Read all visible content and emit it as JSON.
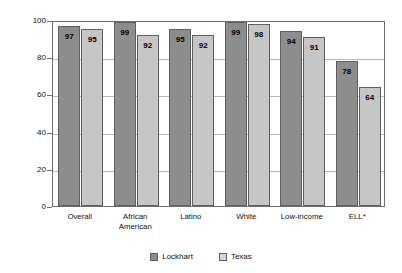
{
  "chart_data": {
    "type": "bar",
    "title": "",
    "subtitle": "",
    "xlabel": "",
    "ylabel": "Percentage of students meeting standards",
    "ylim": [
      0,
      100
    ],
    "yticks": [
      0,
      20,
      40,
      60,
      80,
      100
    ],
    "ytick_labels": [
      "0",
      "20",
      "40",
      "60",
      "80",
      "100"
    ],
    "grid": true,
    "grid_axis": "y",
    "legend_position": "bottom-center",
    "categories": [
      "Overall",
      "African American",
      "Latino",
      "White",
      "Low-income",
      "ELL*"
    ],
    "category_lines": [
      [
        "Overall"
      ],
      [
        "African",
        "American"
      ],
      [
        "Latino"
      ],
      [
        "White"
      ],
      [
        "Low-income"
      ],
      [
        "ELL*"
      ]
    ],
    "series": [
      {
        "name": "Lockhart",
        "color": "#8d8d8d",
        "values": [
          97,
          99,
          95,
          99,
          94,
          78
        ],
        "value_labels": [
          "97",
          "99",
          "95",
          "99",
          "94",
          "78"
        ]
      },
      {
        "name": "Texas",
        "color": "#c6c6c6",
        "values": [
          95,
          92,
          92,
          98,
          91,
          64
        ],
        "value_labels": [
          "95",
          "92",
          "92",
          "98",
          "91",
          "64"
        ]
      }
    ]
  },
  "legend": {
    "items": [
      {
        "label": "Lockhart",
        "swatch": "lockhart"
      },
      {
        "label": "Texas",
        "swatch": "texas"
      }
    ]
  }
}
